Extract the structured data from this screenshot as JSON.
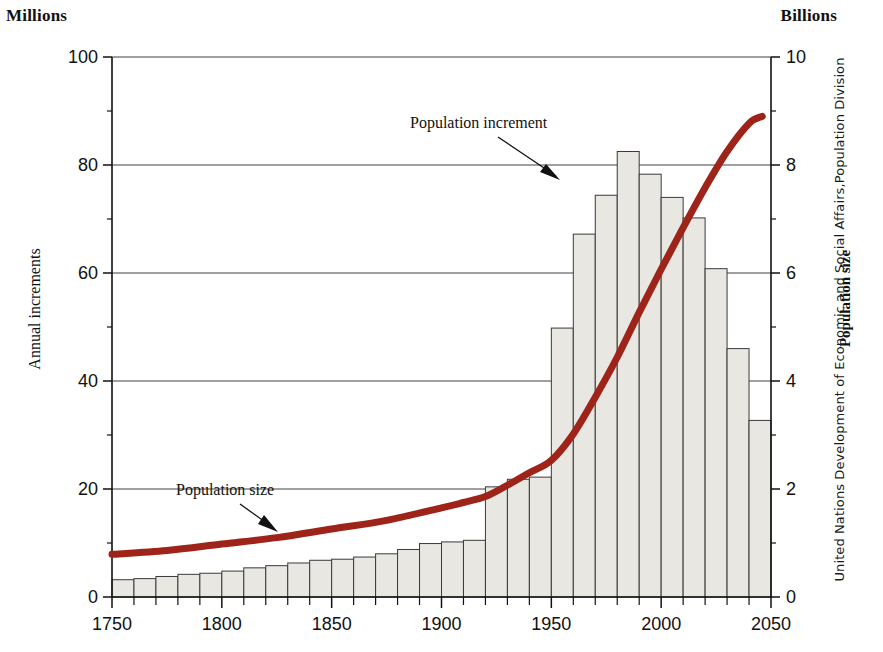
{
  "units": {
    "left": "Millions",
    "right": "Billions"
  },
  "axis_titles": {
    "left": "Annual increments",
    "right": "Population size"
  },
  "source_credit": "United Nations Development of Economic and Social Affairs,Population Division",
  "annotations": {
    "increment": "Population increment",
    "size": "Population size"
  },
  "colors": {
    "curve": "#9e2318",
    "bar_fill": "#e9e7e2",
    "bar_stroke": "#3a3a3a",
    "axis": "#111111",
    "grid": "#2b2b2b"
  },
  "chart_data": {
    "type": "bar",
    "title": "",
    "subtitle": "",
    "xlabel": "",
    "ylabel": "Annual increments",
    "y2label": "Population size",
    "xlim": [
      1750,
      2050
    ],
    "ylim": [
      0,
      100
    ],
    "y2lim": [
      0,
      10
    ],
    "grid": true,
    "legend": "none",
    "x_ticks_major": [
      1750,
      1800,
      1850,
      1900,
      1950,
      2000,
      2050
    ],
    "x_ticks_minor_step": 10,
    "y_ticks_major": [
      0,
      20,
      40,
      60,
      80,
      100
    ],
    "y_ticks_minor": [
      10,
      30,
      50,
      70,
      90
    ],
    "y2_ticks_major": [
      0,
      2,
      4,
      6,
      8,
      10
    ],
    "y2_ticks_minor": [
      1,
      3,
      5,
      7,
      9
    ],
    "bar_width_years": 10,
    "categories": [
      1750,
      1760,
      1770,
      1780,
      1790,
      1800,
      1810,
      1820,
      1830,
      1840,
      1850,
      1860,
      1870,
      1880,
      1890,
      1900,
      1910,
      1920,
      1930,
      1940,
      1950,
      1960,
      1970,
      1980,
      1990,
      2000,
      2010,
      2020,
      2030,
      2040
    ],
    "series": [
      {
        "name": "Population increment",
        "unit": "Millions",
        "axis": "left",
        "kind": "bar",
        "values": [
          3.2,
          3.4,
          3.8,
          4.2,
          4.4,
          4.8,
          5.4,
          5.8,
          6.3,
          6.8,
          7.0,
          7.4,
          8.0,
          8.8,
          9.9,
          10.2,
          10.5,
          20.4,
          21.8,
          22.2,
          49.8,
          67.2,
          74.4,
          82.5,
          78.3,
          74.0,
          70.2,
          60.8,
          46.0,
          32.7
        ]
      },
      {
        "name": "Population size",
        "unit": "Billions",
        "axis": "right",
        "kind": "line",
        "x": [
          1750,
          1775,
          1800,
          1825,
          1850,
          1875,
          1900,
          1910,
          1920,
          1930,
          1940,
          1950,
          1960,
          1970,
          1980,
          1990,
          2000,
          2010,
          2020,
          2030,
          2040,
          2046
        ],
        "values": [
          0.79,
          0.86,
          0.98,
          1.1,
          1.26,
          1.42,
          1.65,
          1.75,
          1.86,
          2.07,
          2.3,
          2.53,
          3.02,
          3.7,
          4.44,
          5.27,
          6.07,
          6.84,
          7.58,
          8.25,
          8.77,
          8.9
        ]
      }
    ]
  }
}
